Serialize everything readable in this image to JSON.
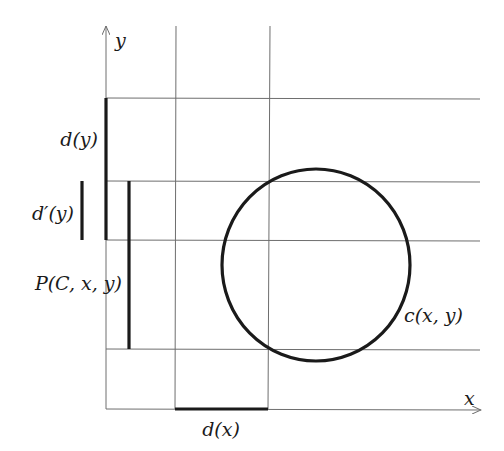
{
  "diagram": {
    "axes": {
      "x_label": "x",
      "y_label": "y"
    },
    "labels": {
      "d_y": "d(y)",
      "d_prime_y": "d′(y)",
      "p_cxy": "P(C, x, y)",
      "c_xy": "c(x, y)",
      "d_x": "d(x)"
    },
    "colors": {
      "thin_line": "#6e6e6e",
      "thick_line": "#1a1a1a",
      "background": "#ffffff"
    }
  }
}
